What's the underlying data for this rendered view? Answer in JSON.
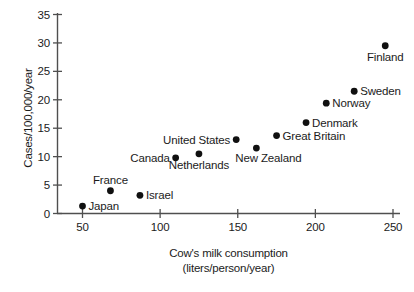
{
  "chart_data": {
    "type": "scatter",
    "title": "",
    "xlabel": "Cow's milk consumption",
    "xlabel_line2": "(liters/person/year)",
    "ylabel": "Cases/100,000/year",
    "xlim": [
      40,
      256
    ],
    "ylim": [
      0,
      35
    ],
    "xticks": [
      50,
      100,
      150,
      200,
      250
    ],
    "xtick_labels": [
      "50",
      "100",
      "150",
      "200",
      "250"
    ],
    "yticks": [
      0,
      5,
      10,
      15,
      20,
      25,
      30,
      35
    ],
    "ytick_labels": [
      "0",
      "5",
      "10",
      "15",
      "20",
      "25",
      "30",
      "35"
    ],
    "grid": false,
    "legend": "none",
    "marker_color": "#101010",
    "axis_color": "#4f4f4f",
    "points": [
      {
        "label": "Japan",
        "x": 50,
        "y": 1.3,
        "label_pos": "right"
      },
      {
        "label": "France",
        "x": 68,
        "y": 4.0,
        "label_pos": "above"
      },
      {
        "label": "Israel",
        "x": 87,
        "y": 3.2,
        "label_pos": "right"
      },
      {
        "label": "Canada",
        "x": 110,
        "y": 9.8,
        "label_pos": "left"
      },
      {
        "label": "Netherlands",
        "x": 125,
        "y": 10.5,
        "label_pos": "below"
      },
      {
        "label": "United States",
        "x": 149,
        "y": 13.0,
        "label_pos": "left"
      },
      {
        "label": "New Zealand",
        "x": 162,
        "y": 11.5,
        "label_pos": "below-right"
      },
      {
        "label": "Great Britain",
        "x": 175,
        "y": 13.7,
        "label_pos": "right"
      },
      {
        "label": "Denmark",
        "x": 194,
        "y": 16.0,
        "label_pos": "right"
      },
      {
        "label": "Norway",
        "x": 207,
        "y": 19.4,
        "label_pos": "right"
      },
      {
        "label": "Sweden",
        "x": 225,
        "y": 21.5,
        "label_pos": "right"
      },
      {
        "label": "Finland",
        "x": 245,
        "y": 29.5,
        "label_pos": "below"
      }
    ]
  }
}
